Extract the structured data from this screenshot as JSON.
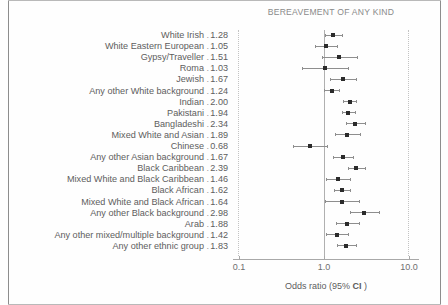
{
  "chart_data": {
    "type": "scatter",
    "subtype": "forest-plot",
    "title": "BEREAVEMENT OF ANY KIND",
    "xlabel": "Odds ratio (95% CI )",
    "ylabel": "",
    "xscale": "log",
    "xlim": [
      0.1,
      10.0
    ],
    "xticks": [
      0.1,
      1.0,
      10.0
    ],
    "xticklabels": [
      "0.1",
      "1.0",
      "10.0"
    ],
    "reference_line": 1.0,
    "grid": false,
    "legend": null,
    "categories": [
      "White Irish",
      "White Eastern European",
      "Gypsy/Traveller",
      "Roma",
      "Jewish",
      "Any other White background",
      "Indian",
      "Pakistani",
      "Bangladeshi",
      "Mixed White and Asian",
      "Chinese",
      "Any other Asian background",
      "Black Caribbean",
      "Mixed White and Black Caribbean",
      "Black African",
      "Mixed White and Black African",
      "Any other Black background",
      "Arab",
      "Any other mixed/multiple background",
      "Any other ethnic group"
    ],
    "values": [
      1.28,
      1.05,
      1.51,
      1.03,
      1.67,
      1.24,
      2.0,
      1.94,
      2.34,
      1.89,
      0.68,
      1.67,
      2.39,
      1.46,
      1.62,
      1.64,
      2.98,
      1.88,
      1.42,
      1.83
    ],
    "value_labels": [
      "1.28",
      "1.05",
      "1.51",
      "1.03",
      "1.67",
      "1.24",
      "2.00",
      "1.94",
      "2.34",
      "1.89",
      "0.68",
      "1.67",
      "2.39",
      "1.46",
      "1.62",
      "1.64",
      "2.98",
      "1.88",
      "1.42",
      "1.83"
    ],
    "ci_low": [
      1.02,
      0.78,
      0.94,
      0.55,
      1.19,
      1.01,
      1.66,
      1.62,
      1.81,
      1.36,
      0.43,
      1.29,
      1.9,
      1.07,
      1.3,
      1.04,
      2.02,
      1.39,
      1.05,
      1.42
    ],
    "ci_high": [
      1.61,
      1.41,
      2.43,
      1.92,
      2.35,
      1.52,
      2.41,
      2.32,
      3.03,
      2.64,
      1.08,
      2.17,
      3.01,
      2.0,
      2.02,
      2.58,
      4.4,
      2.55,
      1.92,
      2.36
    ],
    "marker_color": "#2b2b2b",
    "line_color": "#8e8e8e",
    "reference_line_color": "#b0b0b0",
    "dotted_border_color": "#c3c3c3"
  },
  "label_separator": "."
}
